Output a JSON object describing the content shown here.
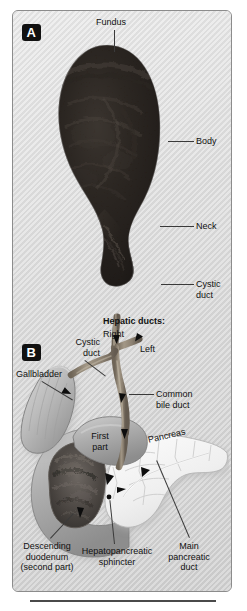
{
  "figure": {
    "panels": [
      {
        "id": "A",
        "badge": "A",
        "description": "Gross specimen photograph of an opened gallbladder",
        "labels": [
          {
            "name": "fundus",
            "text": "Fundus"
          },
          {
            "name": "body",
            "text": "Body"
          },
          {
            "name": "neck",
            "text": "Neck"
          },
          {
            "name": "cystic-duct",
            "text": "Cystic\nduct",
            "line1": "Cystic",
            "line2": "duct"
          }
        ]
      },
      {
        "id": "B",
        "badge": "B",
        "description": "Illustration of the biliary tree, duodenum and pancreas",
        "labels": [
          {
            "name": "hepatic-ducts-heading",
            "text": "Hepatic ducts:",
            "bold": true
          },
          {
            "name": "right-hepatic-duct",
            "text": "Right"
          },
          {
            "name": "left-hepatic-duct",
            "text": "Left"
          },
          {
            "name": "cystic-duct",
            "line1": "Cystic",
            "line2": "duct"
          },
          {
            "name": "gallbladder",
            "text": "Gallbladder"
          },
          {
            "name": "common-bile-duct",
            "line1": "Common",
            "line2": "bile duct"
          },
          {
            "name": "first-part",
            "line1": "First",
            "line2": "part"
          },
          {
            "name": "pancreas",
            "text": "Pancreas"
          },
          {
            "name": "descending-duodenum",
            "line1": "Descending",
            "line2": "duodenum",
            "line3": "(second part)"
          },
          {
            "name": "hepatopancreatic-sphincter",
            "line1": "Hepatopancreatic",
            "line2": "sphincter"
          },
          {
            "name": "main-pancreatic-duct",
            "line1": "Main",
            "line2": "pancreatic",
            "line3": "duct"
          }
        ]
      }
    ],
    "colors": {
      "background": "#d8d8d8",
      "specimen_dark": "#1c1916",
      "duct": "#8e8577",
      "gallbladder_fill": "#b9b9b9",
      "pancreas_fill": "#f2f2f2",
      "duodenum_mucosa": "#4e4a46",
      "label_text": "#111111",
      "leader_line": "#3a3a3a",
      "frame_border": "#8c8c8c",
      "badge_bg": "#111111",
      "badge_text": "#ffffff"
    }
  }
}
